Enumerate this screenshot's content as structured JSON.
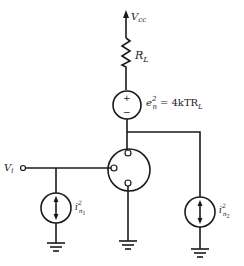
{
  "diagram": {
    "type": "circuit-schematic",
    "labels": {
      "supply": {
        "main": "V",
        "sub": "cc"
      },
      "load_resistor": {
        "main": "R",
        "sub": "L"
      },
      "noise_voltage": {
        "lhs_main": "e",
        "lhs_sup": "2",
        "lhs_sub": "n",
        "eq": "= 4kTR",
        "eq_sub": "L"
      },
      "noise_voltage_plus": "+",
      "noise_voltage_minus": "−",
      "input": {
        "main": "V",
        "sub": "i"
      },
      "input_current_noise": {
        "main": "i",
        "sup": "2",
        "sub": "n",
        "subsub": "1"
      },
      "output_current_noise": {
        "main": "i",
        "sup": "2",
        "sub": "n",
        "subsub": "2"
      }
    },
    "colors": {
      "ink": "#1a1a1a",
      "background": "#ffffff"
    }
  }
}
